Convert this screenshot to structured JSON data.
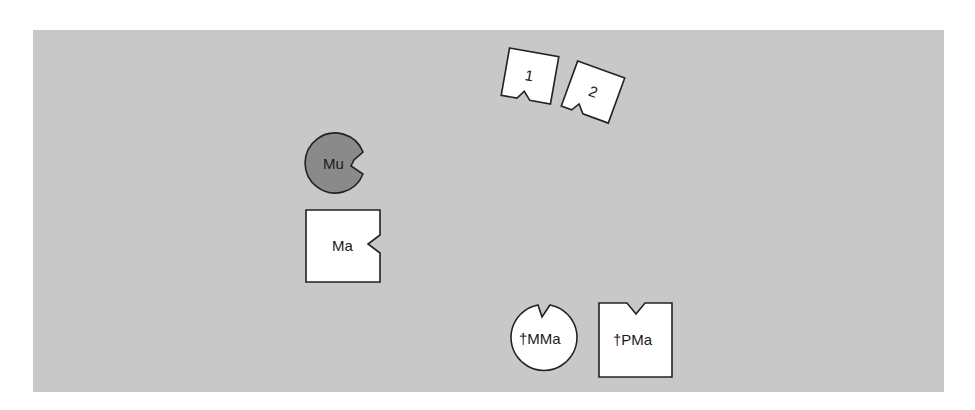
{
  "diagram": {
    "background_color": "#c8c8c8",
    "shapes": [
      {
        "id": "mu",
        "label": "Mu",
        "kind": "circle-notched",
        "fill": "#8a8a8a",
        "notch": "right"
      },
      {
        "id": "ma",
        "label": "Ma",
        "kind": "square-notched",
        "fill": "#ffffff",
        "notch": "right"
      },
      {
        "id": "one",
        "label": "1",
        "kind": "square-notched",
        "fill": "#ffffff",
        "notch": "bottom"
      },
      {
        "id": "two",
        "label": "2",
        "kind": "square-notched",
        "fill": "#ffffff",
        "notch": "bottom"
      },
      {
        "id": "mma",
        "label": "†MMa",
        "kind": "circle-notched",
        "fill": "#ffffff",
        "notch": "top"
      },
      {
        "id": "pma",
        "label": "†PMa",
        "kind": "square-notched",
        "fill": "#ffffff",
        "notch": "top"
      }
    ]
  }
}
